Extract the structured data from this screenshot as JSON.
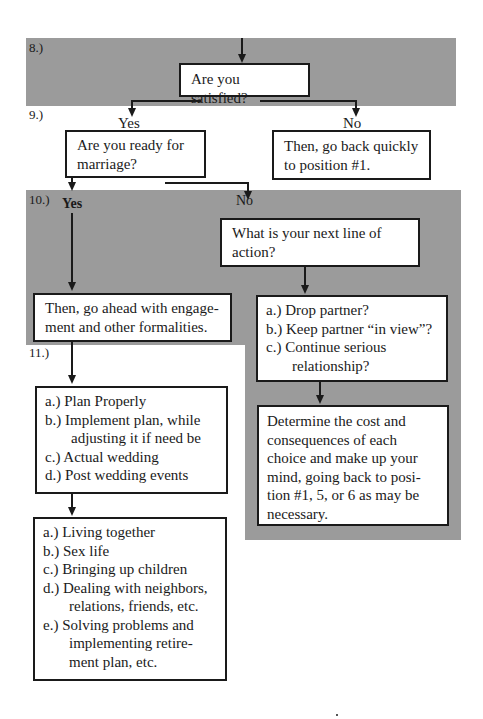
{
  "steps": {
    "s8": "8.)",
    "s9": "9.)",
    "s10": "10.)",
    "s11": "11.)"
  },
  "labels": {
    "yes9": "Yes",
    "no9": "No",
    "yes10": "Yes",
    "no10": "No"
  },
  "boxes": {
    "satisfied": "Are you satisfied?",
    "ready": "Are you ready for marriage?",
    "go_back": "Then, go back quickly to position #1.",
    "next_action": "What is your next line of action?",
    "engagement": "Then, go ahead with engage-ment and other formalities.",
    "options": [
      "a.) Drop partner?",
      "b.) Keep partner “in view”?",
      "c.) Continue serious relationship?"
    ],
    "determine": "Determine the cost and consequences of each choice and make up your mind, going back to posi-tion #1, 5, or 6 as may be necessary.",
    "plan": [
      "a.) Plan Properly",
      "b.) Implement plan, while adjusting it if need be",
      "c.) Actual wedding",
      "d.) Post wedding events"
    ],
    "living": [
      "a.) Living together",
      "b.) Sex life",
      "c.) Bringing up children",
      "d.) Dealing with neighbors, relations, friends, etc.",
      "e.) Solving problems and implementing retire-ment plan, etc."
    ]
  },
  "colors": {
    "band": "#9b9b9b",
    "line": "#1a1a1a"
  }
}
